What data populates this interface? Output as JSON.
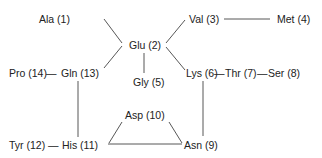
{
  "diagram": {
    "type": "amino-acid-network",
    "nodes": [
      {
        "id": 1,
        "label": "Ala (1)"
      },
      {
        "id": 2,
        "label": "Glu (2)"
      },
      {
        "id": 3,
        "label": "Val (3)"
      },
      {
        "id": 4,
        "label": "Met (4)"
      },
      {
        "id": 5,
        "label": "Gly (5)"
      },
      {
        "id": 6,
        "label": "Lys (6)"
      },
      {
        "id": 7,
        "label": "Thr (7)"
      },
      {
        "id": 8,
        "label": "Ser (8)"
      },
      {
        "id": 9,
        "label": "Asn (9)"
      },
      {
        "id": 10,
        "label": "Asp (10)"
      },
      {
        "id": 11,
        "label": "His (11)"
      },
      {
        "id": 12,
        "label": "Tyr (12)"
      },
      {
        "id": 13,
        "label": "Gln (13)"
      },
      {
        "id": 14,
        "label": "Pro (14)"
      }
    ],
    "edges": [
      {
        "from": 1,
        "to": 2
      },
      {
        "from": 13,
        "to": 2
      },
      {
        "from": 2,
        "to": 3
      },
      {
        "from": 2,
        "to": 6
      },
      {
        "from": 2,
        "to": 5
      },
      {
        "from": 3,
        "to": 4
      },
      {
        "from": 6,
        "to": 7
      },
      {
        "from": 7,
        "to": 8
      },
      {
        "from": 6,
        "to": 9
      },
      {
        "from": 14,
        "to": 13
      },
      {
        "from": 13,
        "to": 11
      },
      {
        "from": 12,
        "to": 11
      },
      {
        "from": 11,
        "to": 10
      },
      {
        "from": 10,
        "to": 9
      },
      {
        "from": 11,
        "to": 9
      }
    ],
    "connector_glyph": "—",
    "line_color": "#444444",
    "text_color": "#222222"
  }
}
